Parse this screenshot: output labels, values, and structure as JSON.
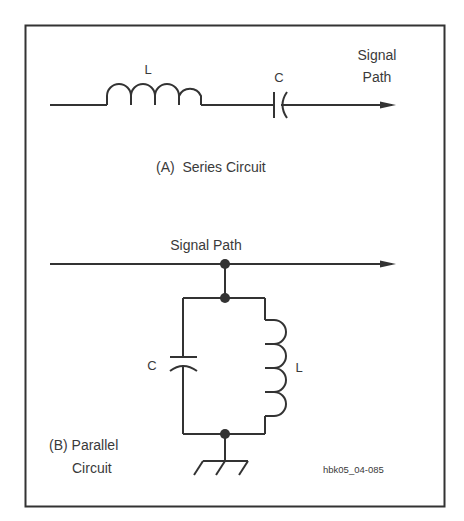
{
  "diagram": {
    "figure_id": "hbk05_04-085",
    "series_circuit": {
      "caption": "(A)  Series Circuit",
      "inductor_label": "L",
      "capacitor_label": "C",
      "signal_label_line1": "Signal",
      "signal_label_line2": "Path"
    },
    "parallel_circuit": {
      "caption_line1": "(B) Parallel",
      "caption_line2": "Circuit",
      "signal_label": "Signal Path",
      "capacitor_label": "C",
      "inductor_label": "L"
    },
    "colors": {
      "stroke": "#333333",
      "text": "#3a3a3a",
      "background": "#ffffff"
    }
  }
}
